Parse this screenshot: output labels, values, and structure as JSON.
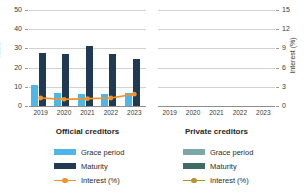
{
  "chart_data": {
    "type": "bar",
    "title": "",
    "subtitle": "",
    "categories": [
      "2019",
      "2020",
      "2021",
      "2022",
      "2023"
    ],
    "ylabel": "Years",
    "ylabel_right": "Interest (%)",
    "xlabel": "",
    "ylim": [
      0,
      50
    ],
    "ylim_right": [
      0,
      15
    ],
    "yticks": [
      "50",
      "40",
      "30",
      "20",
      "10",
      "0"
    ],
    "yticks_right": [
      "15",
      "12",
      "9",
      "6",
      "3",
      "0"
    ],
    "grid": true,
    "legend_position": "bottom",
    "panels": [
      {
        "name": "official-creditors",
        "caption": "Official creditors",
        "series": [
          {
            "name": "Grace period",
            "type": "bar",
            "axis": "left",
            "color": "#4cb7e8",
            "values": [
              11.0,
              6.8,
              6.3,
              6.3,
              6.6
            ]
          },
          {
            "name": "Maturity",
            "type": "bar",
            "axis": "left",
            "color": "#1f3a52",
            "values": [
              27.8,
              27.0,
              31.0,
              27.3,
              24.6
            ]
          },
          {
            "name": "Interest (%)",
            "type": "line",
            "axis": "right",
            "color": "#f0932b",
            "values": [
              1.25,
              1.05,
              1.15,
              1.25,
              1.85
            ]
          }
        ]
      },
      {
        "name": "private-creditors",
        "caption": "Private creditors",
        "series": [
          {
            "name": "Grace period",
            "type": "bar",
            "axis": "left",
            "color": "#7ba7a6",
            "values": [
              null,
              null,
              null,
              null,
              null
            ]
          },
          {
            "name": "Maturity",
            "type": "bar",
            "axis": "left",
            "color": "#3f6b66",
            "values": [
              null,
              null,
              null,
              null,
              null
            ]
          },
          {
            "name": "Interest (%)",
            "type": "line",
            "axis": "right",
            "color": "#b3952f",
            "values": [
              null,
              null,
              null,
              null,
              null
            ]
          }
        ]
      }
    ]
  },
  "legend": {
    "official": {
      "title": "Official creditors",
      "items": [
        {
          "label": "Grace period",
          "color": "#4cb7e8",
          "marker": "box"
        },
        {
          "label": "Maturity",
          "color": "#1f3a52",
          "marker": "box"
        },
        {
          "label": "Interest (%)",
          "color": "#f0932b",
          "marker": "line"
        }
      ]
    },
    "private": {
      "title": "Private creditors",
      "items": [
        {
          "label": "Grace period",
          "color": "#7ba7a6",
          "marker": "box"
        },
        {
          "label": "Maturity",
          "color": "#3f6b66",
          "marker": "box"
        },
        {
          "label": "Interest (%)",
          "color": "#b3952f",
          "marker": "line"
        }
      ]
    }
  }
}
